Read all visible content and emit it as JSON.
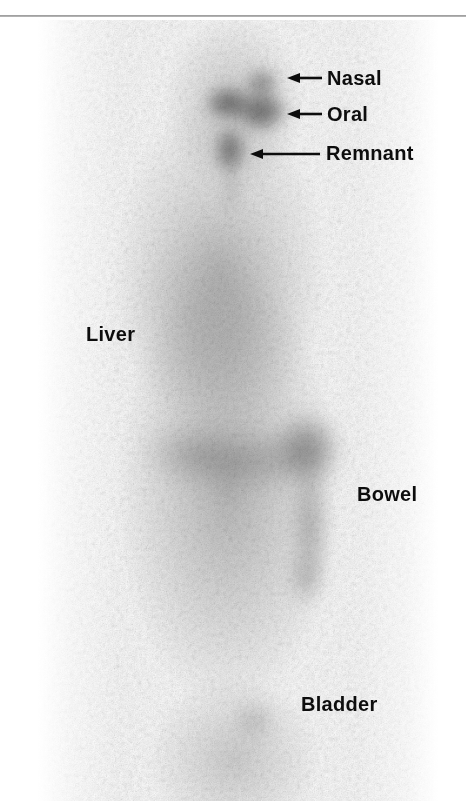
{
  "figure": {
    "modality": "whole-body radioiodine scintigram",
    "orientation": "anterior whole-body view",
    "background_color": "#ffffff",
    "ink_color": "#0d0d0d"
  },
  "top_rule": {
    "name": "page-edge-rule",
    "color": "#8f8f8f"
  },
  "annotations": [
    {
      "id": "nasal",
      "label": "Nasal",
      "label_x": 327,
      "label_y": 68,
      "has_arrow": true,
      "arrow_tip_x": 287,
      "arrow_tip_y": 78,
      "arrow_tail_x": 322,
      "arrow_tail_y": 78
    },
    {
      "id": "oral",
      "label": "Oral",
      "label_x": 327,
      "label_y": 104,
      "has_arrow": true,
      "arrow_tip_x": 287,
      "arrow_tip_y": 114,
      "arrow_tail_x": 322,
      "arrow_tail_y": 114
    },
    {
      "id": "remnant",
      "label": "Remnant",
      "label_x": 326,
      "label_y": 143,
      "has_arrow": true,
      "arrow_tip_x": 250,
      "arrow_tip_y": 154,
      "arrow_tail_x": 320,
      "arrow_tail_y": 154
    },
    {
      "id": "liver",
      "label": "Liver",
      "label_x": 86,
      "label_y": 324,
      "has_arrow": false,
      "arrow_tip_x": 0,
      "arrow_tip_y": 0,
      "arrow_tail_x": 0,
      "arrow_tail_y": 0
    },
    {
      "id": "bowel",
      "label": "Bowel",
      "label_x": 357,
      "label_y": 484,
      "has_arrow": false,
      "arrow_tip_x": 0,
      "arrow_tip_y": 0,
      "arrow_tail_x": 0,
      "arrow_tail_y": 0
    },
    {
      "id": "bladder",
      "label": "Bladder",
      "label_x": 301,
      "label_y": 694,
      "has_arrow": false,
      "arrow_tip_x": 0,
      "arrow_tip_y": 0,
      "arrow_tail_x": 0,
      "arrow_tail_y": 0
    }
  ],
  "uptake_foci": [
    {
      "id": "nasal-focus",
      "cx": 224,
      "cy": 63,
      "rx": 15,
      "ry": 13,
      "intensity": 0.5,
      "blur": 7
    },
    {
      "id": "oral-focus-left",
      "cx": 190,
      "cy": 83,
      "rx": 21,
      "ry": 15,
      "intensity": 0.62,
      "blur": 7
    },
    {
      "id": "oral-focus-right",
      "cx": 224,
      "cy": 91,
      "rx": 23,
      "ry": 18,
      "intensity": 0.66,
      "blur": 7
    },
    {
      "id": "thyroid-remnant",
      "cx": 192,
      "cy": 130,
      "rx": 14,
      "ry": 21,
      "intensity": 0.6,
      "blur": 7
    },
    {
      "id": "remnant-tail",
      "cx": 193,
      "cy": 168,
      "rx": 4,
      "ry": 24,
      "intensity": 0.28,
      "blur": 7
    },
    {
      "id": "liver-diffuse",
      "cx": 176,
      "cy": 300,
      "rx": 72,
      "ry": 84,
      "intensity": 0.16,
      "blur": 22
    },
    {
      "id": "bowel-transverse",
      "cx": 215,
      "cy": 440,
      "rx": 74,
      "ry": 22,
      "intensity": 0.26,
      "blur": 14
    },
    {
      "id": "bowel-hepatic",
      "cx": 270,
      "cy": 428,
      "rx": 27,
      "ry": 30,
      "intensity": 0.46,
      "blur": 11
    },
    {
      "id": "bowel-descending",
      "cx": 272,
      "cy": 505,
      "rx": 11,
      "ry": 60,
      "intensity": 0.4,
      "blur": 10
    },
    {
      "id": "bowel-sigmoid",
      "cx": 268,
      "cy": 560,
      "rx": 10,
      "ry": 22,
      "intensity": 0.34,
      "blur": 10
    },
    {
      "id": "bowel-loop-left",
      "cx": 150,
      "cy": 432,
      "rx": 40,
      "ry": 20,
      "intensity": 0.22,
      "blur": 14
    },
    {
      "id": "bladder-focus",
      "cx": 216,
      "cy": 700,
      "rx": 16,
      "ry": 16,
      "intensity": 0.24,
      "blur": 10
    }
  ]
}
